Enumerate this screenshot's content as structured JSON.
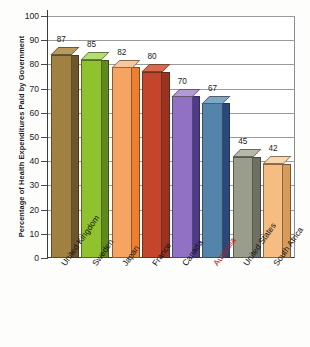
{
  "chart_data": {
    "type": "bar",
    "title": "",
    "subtitle": "",
    "xlabel": "",
    "ylabel": "Percentage of Health Expenditures Paid by Government",
    "ylim": [
      0,
      100
    ],
    "yticks": [
      0,
      10,
      20,
      30,
      40,
      50,
      60,
      70,
      80,
      90,
      100
    ],
    "ytick_labels": [
      "0",
      "10",
      "20",
      "30",
      "40",
      "50",
      "60",
      "70",
      "80",
      "90",
      "100"
    ],
    "grid": true,
    "legend": "none",
    "style": "3d-column",
    "categories": [
      "United Kingdom",
      "Sweden",
      "Japan",
      "France",
      "Canada",
      "Australia",
      "United States",
      "South Africa"
    ],
    "values": [
      87,
      85,
      82,
      80,
      70,
      67,
      45,
      42
    ],
    "value_labels": [
      "87",
      "85",
      "82",
      "80",
      "70",
      "67",
      "45",
      "42"
    ],
    "bar_colors": [
      "#a08142",
      "#90c230",
      "#f5a462",
      "#c4452b",
      "#9071c4",
      "#5584ab",
      "#9a9c8c",
      "#f6bd82"
    ],
    "bar_side_colors": [
      "#6d5628",
      "#5e8a1c",
      "#ef7e2e",
      "#9c3220",
      "#4b3a8e",
      "#28497e",
      "#6d7063",
      "#d79a58"
    ],
    "bar_top_colors": [
      "#b99a5c",
      "#b4dd72",
      "#f9c79d",
      "#d96a4e",
      "#b09ad8",
      "#7ea7c8",
      "#b6b8aa",
      "#f8d6ae"
    ],
    "highlighted_category": "Australia",
    "highlight_color": "#b32020"
  }
}
